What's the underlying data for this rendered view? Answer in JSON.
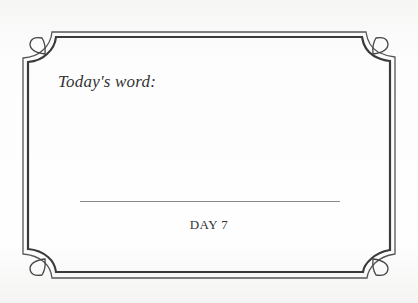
{
  "card": {
    "prompt": "Today's word:",
    "day_label": "DAY 7",
    "colors": {
      "frame": "#3a3a3a",
      "text": "#333333",
      "answer_line": "#8a8a8a",
      "background": "#fefefe"
    }
  }
}
